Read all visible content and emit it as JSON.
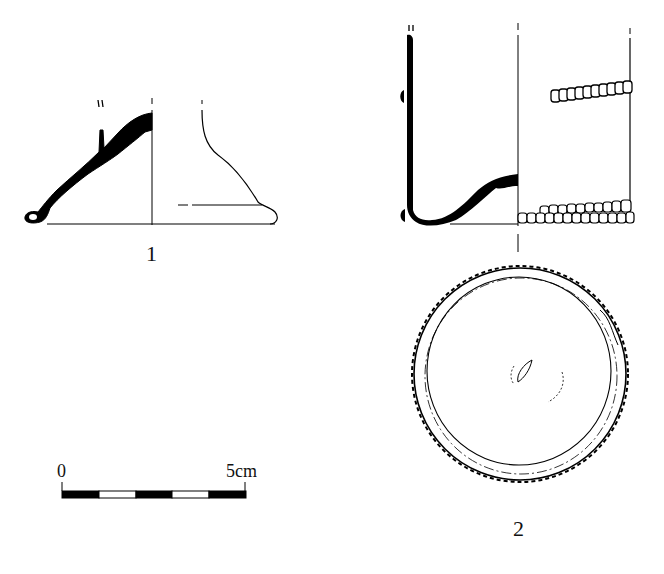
{
  "figure": {
    "items": [
      {
        "id": "1",
        "label": "1",
        "description": "Glass vessel base/foot profile — section (left) and exterior view (right)"
      },
      {
        "id": "2",
        "label": "2",
        "description": "Cylindrical glass beaker with applied trails — section, exterior view, and base plan"
      }
    ],
    "scale_bar": {
      "start_label": "0",
      "end_label": "5cm",
      "segments": 5,
      "colors": [
        "#000000",
        "#ffffff",
        "#000000",
        "#ffffff",
        "#000000"
      ]
    },
    "colors": {
      "ink": "#111111",
      "background": "#ffffff"
    }
  }
}
